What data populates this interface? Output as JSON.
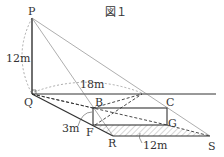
{
  "title": "図１",
  "points": {
    "P": "P",
    "Q": "Q",
    "B": "B",
    "C": "C",
    "F": "F",
    "G": "G",
    "R": "R",
    "S": "S"
  },
  "measurements": {
    "PQ": "12m",
    "Q_to_intersection": "18m",
    "BF": "3m",
    "RS": "12m"
  },
  "colors": {
    "line": "#333333",
    "thin_line": "#777777",
    "dashed_arc": "#888888",
    "hatch": "#999999"
  }
}
